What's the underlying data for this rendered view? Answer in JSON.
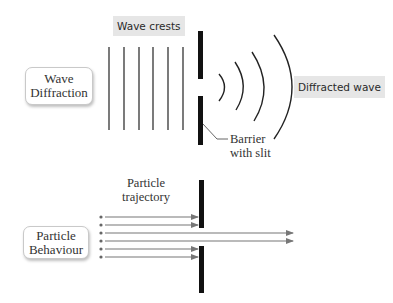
{
  "wave_section": {
    "title_line1": "Wave",
    "title_line2": "Diffraction",
    "crests_label": "Wave crests",
    "diffracted_label": "Diffracted wave",
    "barrier_label_line1": "Barrier",
    "barrier_label_line2": "with slit",
    "crest_count": 6,
    "arc_count": 4
  },
  "particle_section": {
    "title_line1": "Particle",
    "title_line2": "Behaviour",
    "trajectory_label_line1": "Particle",
    "trajectory_label_line2": "trajectory",
    "particle_count": 6,
    "blocked_count": 4,
    "passed_count": 2
  },
  "colors": {
    "barrier": "#111111",
    "crest_line": "#333333",
    "arrow": "#777777",
    "tag_bg": "#e6e6e6",
    "box_border": "#c9c9c9"
  }
}
